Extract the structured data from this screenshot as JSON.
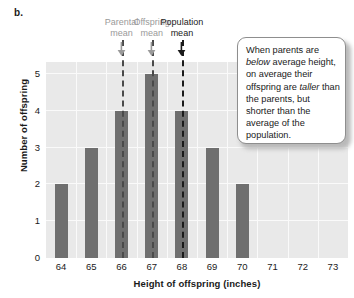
{
  "panel": {
    "label": "b."
  },
  "chart_data": {
    "type": "bar",
    "title": "",
    "xlabel": "Height of offspring (inches)",
    "ylabel": "Number of offspring",
    "categories": [
      "64",
      "65",
      "66",
      "67",
      "68",
      "69",
      "70",
      "71",
      "72",
      "73"
    ],
    "values": [
      2,
      3,
      4,
      5,
      4,
      3,
      2,
      0,
      0,
      0
    ],
    "ylim": [
      0,
      5
    ],
    "yticks": [
      "0",
      "1",
      "2",
      "3",
      "4",
      "5"
    ],
    "grid": true,
    "legend": "none",
    "bar_color": "#6f6f6f",
    "plot_background": "#e9e9e9",
    "gridline_color": "#fafafa",
    "annotations": [
      {
        "name": "parental-mean",
        "label_line1": "Parental",
        "label_line2": "mean",
        "x_value": "66",
        "color": "#9a9a9a"
      },
      {
        "name": "offspring-mean",
        "label_line1": "Offspring",
        "label_line2": "mean",
        "x_value": "67",
        "color": "#9a9a9a"
      },
      {
        "name": "population-mean",
        "label_line1": "Population",
        "label_line2": "mean",
        "x_value": "68",
        "color": "#1a1a1a"
      }
    ]
  },
  "callout": {
    "segments": [
      {
        "text": "When parents are ",
        "italic": false
      },
      {
        "text": "below",
        "italic": true
      },
      {
        "text": " average height, on average their offspring are ",
        "italic": false
      },
      {
        "text": "taller",
        "italic": true
      },
      {
        "text": " than the parents, but shorter than the average of the population.",
        "italic": false
      }
    ]
  }
}
